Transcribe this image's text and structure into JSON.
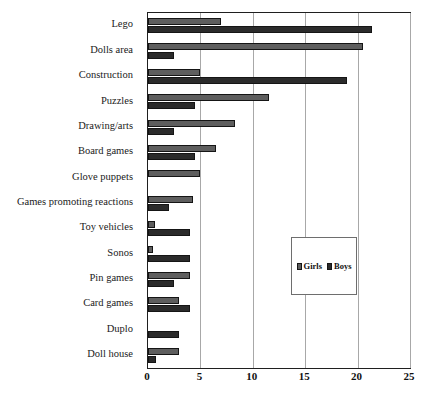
{
  "chart_data": {
    "type": "bar",
    "orientation": "horizontal",
    "title": "",
    "subtitle": "",
    "xlabel": "",
    "ylabel": "",
    "xlim": [
      0,
      25
    ],
    "ylim": null,
    "grid": true,
    "grid_axis": "x",
    "legend_position": "center-right-inside",
    "xticks": [
      0,
      5,
      10,
      15,
      20,
      25
    ],
    "xtick_labels": [
      "0",
      "5",
      "10",
      "15",
      "20",
      "25"
    ],
    "categories": [
      "Lego",
      "Dolls area",
      "Construction",
      "Puzzles",
      "Drawing/arts",
      "Board games",
      "Glove puppets",
      "Games promoting reactions",
      "Toy vehicles",
      "Sonos",
      "Pin  games",
      "Card games",
      "Duplo",
      "Doll house"
    ],
    "series": [
      {
        "name": "Girls",
        "color": "#5e5e5e",
        "values": [
          7,
          20.5,
          5,
          11.5,
          8.3,
          6.5,
          5,
          4.3,
          0.7,
          0.5,
          4,
          3,
          0,
          3
        ]
      },
      {
        "name": "Boys",
        "color": "#2b2b2b",
        "values": [
          21.4,
          2.5,
          19,
          4.5,
          2.5,
          4.5,
          0,
          2,
          4,
          4,
          2.5,
          4,
          3,
          0.8
        ]
      }
    ]
  },
  "legend": {
    "entries": [
      {
        "label": "Girls",
        "color": "#5e5e5e"
      },
      {
        "label": "Boys",
        "color": "#2b2b2b"
      }
    ]
  },
  "colors": {
    "girls": "#5e5e5e",
    "boys": "#2b2b2b",
    "frame": "#1f1f1f",
    "grid": "#a8a8a8",
    "background": "#ffffff"
  }
}
